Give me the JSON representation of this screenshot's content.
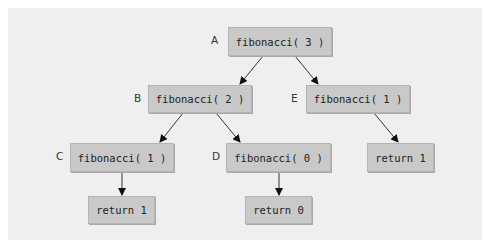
{
  "diagram": {
    "title": "",
    "background_color": "#efefef",
    "node_color": "#c9c9c9",
    "nodes": [
      {
        "id": "A",
        "label": "A",
        "text": "fibonacci( 3 )"
      },
      {
        "id": "B",
        "label": "B",
        "text": "fibonacci( 2 )"
      },
      {
        "id": "E",
        "label": "E",
        "text": "fibonacci( 1 )"
      },
      {
        "id": "C",
        "label": "C",
        "text": "fibonacci( 1 )"
      },
      {
        "id": "D",
        "label": "D",
        "text": "fibonacci( 0 )"
      },
      {
        "id": "E_ret",
        "label": "",
        "text": "return 1"
      },
      {
        "id": "C_ret",
        "label": "",
        "text": "return 1"
      },
      {
        "id": "D_ret",
        "label": "",
        "text": "return 0"
      }
    ],
    "edges": [
      {
        "from": "A",
        "to": "B"
      },
      {
        "from": "A",
        "to": "E"
      },
      {
        "from": "B",
        "to": "C"
      },
      {
        "from": "B",
        "to": "D"
      },
      {
        "from": "E",
        "to": "E_ret"
      },
      {
        "from": "C",
        "to": "C_ret"
      },
      {
        "from": "D",
        "to": "D_ret"
      }
    ]
  }
}
